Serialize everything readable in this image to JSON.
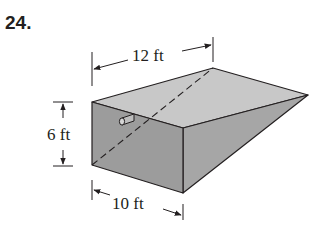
{
  "problem": {
    "number": "24."
  },
  "figure": {
    "dimensions": {
      "length_label": "12 ft",
      "height_label": "6 ft",
      "width_label": "10 ft"
    },
    "colors": {
      "front_face": "#9e9e9e",
      "top_face": "#c8c8c8",
      "side_face": "#a8a8a8",
      "outline": "#231f20",
      "background": "#ffffff"
    }
  }
}
